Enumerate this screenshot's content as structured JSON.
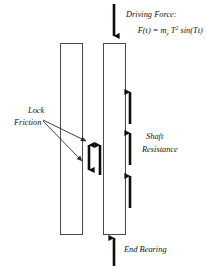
{
  "figure": {
    "background_color": "#ffffff",
    "line_color": "#0d0d0d",
    "outline_color": "#4a4a4a"
  },
  "labels": {
    "driving_force_title": "Driving Force:",
    "driving_force_formula_prefix": "F(t) = m",
    "driving_force_formula_sub1": "r",
    "driving_force_formula_mid": " T",
    "driving_force_formula_sup": "2",
    "driving_force_formula_suffix": " sin(Tt)",
    "driving_force_formula_plain": "F(t) = m_r T2 sin(Tt)",
    "lock_friction_line1": "Lock",
    "lock_friction_line2": "Friction",
    "shaft_resistance_line1": "Shaft",
    "shaft_resistance_line2": "Resistance",
    "end_bearing": "End Bearing"
  },
  "elements": {
    "left_pile_name": "left-pile-section",
    "right_pile_name": "right-pile-section",
    "driving_force_arrow_direction": "down",
    "end_bearing_arrow_direction": "up",
    "shaft_resistance_arrow_count": 3,
    "shaft_resistance_arrow_direction": "up",
    "lock_friction_arrow_double_direction": "up-down",
    "lock_friction_arrow_single_direction": "up"
  }
}
